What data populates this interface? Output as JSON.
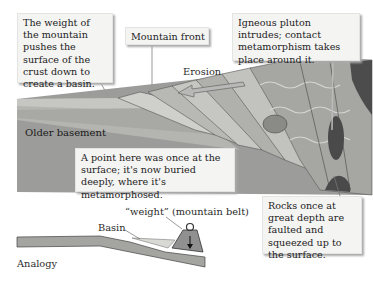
{
  "diagram": {
    "type": "geologic cross-section of a fold-thrust mountain belt with foreland basin, plus mechanical analogy",
    "callouts": {
      "weight": "The weight of the mountain pushes the surface of the crust down to create a basin.",
      "mountain_front": "Mountain front",
      "pluton": "Igneous pluton intrudes; contact metamorphism takes place around it.",
      "buried_point": "A point here was once at the surface; it's now buried deeply, where it's metamorphosed.",
      "faulted_rocks": "Rocks once at great depth are faulted and squeezed up to the surface."
    },
    "labels": {
      "erosion": "Erosion",
      "older_basement": "Older basement",
      "weight_label": "“weight” (mountain belt)",
      "basin": "Basin",
      "analogy": "Analogy"
    },
    "colors": {
      "basement": "#9a9a98",
      "strata_light": "#c8c8c4",
      "strata_mid": "#b2b2ae",
      "strata_dark": "#8c8c88",
      "pluton": "#4a4a4a",
      "callout_bg": "#f4f4f2",
      "arrow": "#b8b8b6"
    }
  }
}
